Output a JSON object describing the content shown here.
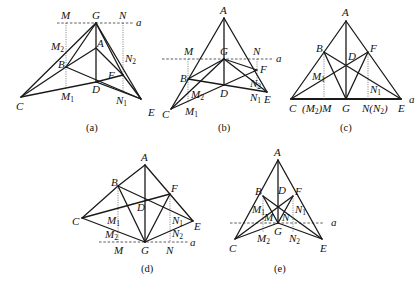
{
  "figures": [
    {
      "id": "a",
      "caption": "(a)",
      "line_label": "a",
      "points": {
        "G": [
          96,
          23
        ],
        "A": [
          96,
          48
        ],
        "B": [
          66,
          67
        ],
        "D": [
          96,
          82
        ],
        "F": [
          123,
          75
        ],
        "C": [
          21,
          97
        ],
        "E": [
          141,
          99
        ],
        "M": [
          66,
          23
        ],
        "N": [
          123,
          23
        ],
        "M1": [
          66,
          88
        ],
        "N1": [
          123,
          92
        ],
        "M2": [
          66,
          55
        ],
        "N2": [
          123,
          52
        ]
      }
    },
    {
      "id": "b",
      "caption": "(b)",
      "line_label": "a",
      "points": {
        "A": [
          224,
          18
        ],
        "G": [
          224,
          59
        ],
        "B": [
          188,
          79
        ],
        "D": [
          224,
          85
        ],
        "F": [
          257,
          70
        ],
        "C": [
          171,
          109
        ],
        "E": [
          267,
          92
        ],
        "M": [
          188,
          59
        ],
        "N": [
          257,
          59
        ],
        "M2": [
          188,
          95
        ],
        "M1": [
          188,
          103
        ],
        "N2": [
          257,
          82
        ],
        "N1": [
          257,
          89
        ]
      }
    },
    {
      "id": "c",
      "caption": "(c)",
      "line_label": "a",
      "points": {
        "A": [
          346,
          21
        ],
        "B": [
          324,
          52
        ],
        "F": [
          368,
          52
        ],
        "D": [
          346,
          63
        ],
        "C": [
          291,
          99
        ],
        "E": [
          401,
          99
        ],
        "G": [
          346,
          99
        ],
        "M": [
          324,
          99
        ],
        "N": [
          368,
          99
        ],
        "M1": [
          324,
          79
        ],
        "N1": [
          368,
          88
        ]
      },
      "base_labels": {
        "M": "(M₂)M",
        "N": "N(N₂)"
      }
    },
    {
      "id": "d",
      "caption": "(d)",
      "line_label": "a",
      "points": {
        "A": [
          145,
          165
        ],
        "B": [
          118,
          186
        ],
        "F": [
          170,
          194
        ],
        "D": [
          145,
          208
        ],
        "C": [
          82,
          218
        ],
        "E": [
          193,
          221
        ],
        "G": [
          145,
          242
        ],
        "M": [
          118,
          242
        ],
        "N": [
          170,
          242
        ],
        "M1": [
          118,
          223
        ],
        "N1": [
          170,
          223
        ],
        "M2": [
          118,
          237
        ],
        "N2": [
          170,
          234
        ]
      }
    },
    {
      "id": "e",
      "caption": "(e)",
      "line_label": "a",
      "points": {
        "A": [
          278,
          160
        ],
        "B": [
          263,
          196
        ],
        "F": [
          293,
          196
        ],
        "D": [
          278,
          208
        ],
        "C": [
          235,
          239
        ],
        "E": [
          322,
          239
        ],
        "G": [
          278,
          223
        ],
        "M": [
          263,
          223
        ],
        "N": [
          293,
          223
        ],
        "M1": [
          263,
          212
        ],
        "N1": [
          293,
          212
        ],
        "M2": [
          263,
          232
        ],
        "N2": [
          293,
          232
        ]
      }
    }
  ],
  "labels": {
    "A": "A",
    "B": "B",
    "C": "C",
    "D": "D",
    "E": "E",
    "F": "F",
    "G": "G",
    "M": "M",
    "N": "N",
    "a": "a",
    "sub1": "1",
    "sub2": "2",
    "M2M": "(M",
    "M2M_sub": "2",
    "M2M_tail": ")M",
    "NN2": "N(N",
    "NN2_sub": "2",
    "NN2_tail": ")"
  },
  "captions": [
    "(a)",
    "(b)",
    "(c)",
    "(d)",
    "(e)"
  ]
}
